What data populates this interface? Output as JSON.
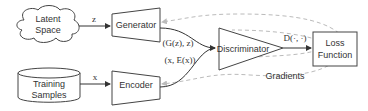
{
  "diagram": {
    "nodes": {
      "latent_space": {
        "line1": "Latent",
        "line2": "Space",
        "shape": "cloud"
      },
      "training_samples": {
        "line1": "Training",
        "line2": "Samples",
        "shape": "cylinder"
      },
      "generator": {
        "label": "Generator",
        "shape": "trapezoid"
      },
      "encoder": {
        "label": "Encoder",
        "shape": "trapezoid"
      },
      "discriminator": {
        "label": "Discriminator",
        "shape": "triangle"
      },
      "loss_function": {
        "line1": "Loss",
        "line2": "Function",
        "shape": "rectangle"
      }
    },
    "edges": {
      "z": "z",
      "x": "x",
      "gen_out": "(G(z), z)",
      "enc_out": "(x, E(x))",
      "disc_out": "D(·, ·)",
      "gradients": "Gradients"
    },
    "colors": {
      "stroke": "#444444",
      "text": "#333333",
      "gradient_arrow": "#bbbbbb"
    }
  }
}
